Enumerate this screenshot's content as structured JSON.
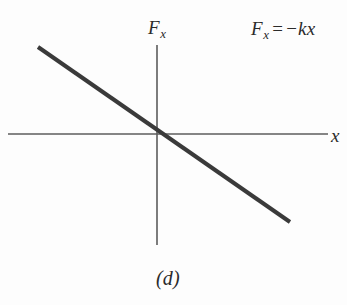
{
  "figure": {
    "caption": "(d)",
    "background_color": "#fdfdfd",
    "axis_color": "#5c5c5c",
    "curve_color": "#3a3a3a",
    "text_color": "#2b2b2b"
  },
  "labels": {
    "y_axis_symbol": "F",
    "y_axis_subscript": "x",
    "x_axis_symbol": "x",
    "equation_symbol": "F",
    "equation_subscript": "x",
    "equation_operator": "=",
    "equation_sign": "−",
    "equation_rhs": "kx",
    "equation_full": "Fₓ = −kx"
  },
  "chart_data": {
    "type": "line",
    "title": "",
    "subtitle": "",
    "xlabel": "x",
    "ylabel": "Fₓ",
    "annotations": [
      "Fₓ = −kx",
      "(d)"
    ],
    "legend": [],
    "grid": false,
    "axes": {
      "origin_px": [
        157,
        134
      ],
      "x_axis_start_px": [
        8,
        134
      ],
      "x_axis_end_px": [
        328,
        134
      ],
      "y_axis_top_px": [
        157,
        45
      ],
      "y_axis_bottom_px": [
        157,
        245
      ],
      "x_axis_arrow": false,
      "y_axis_arrow": false
    },
    "series": [
      {
        "name": "Fₓ = −kx",
        "relationship": "linear through origin, negative slope",
        "slope": -0.695,
        "intercept": 0,
        "points_px": [
          [
            38,
            47
          ],
          [
            290,
            222
          ]
        ],
        "x": [
          -119,
          133
        ],
        "y": [
          87,
          -88
        ],
        "color": "#3a3a3a",
        "width_px": 4
      }
    ],
    "xlim": [
      -149,
      171
    ],
    "ylim": [
      -111,
      89
    ]
  }
}
